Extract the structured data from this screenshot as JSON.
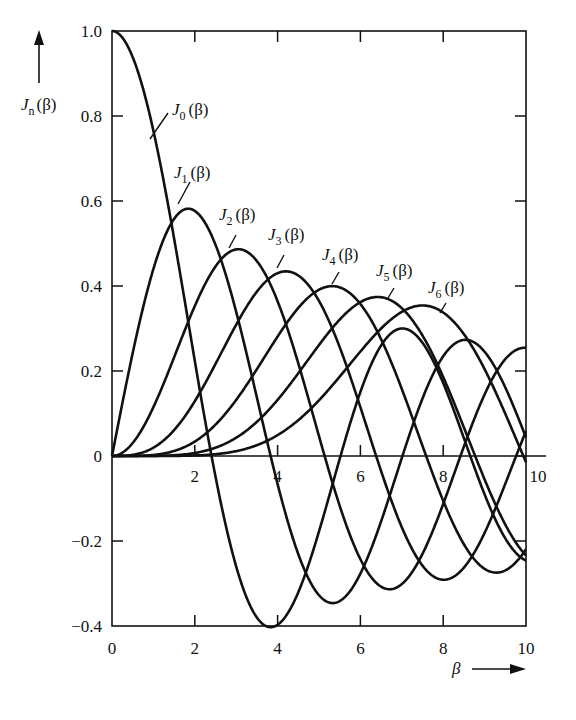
{
  "chart_data": {
    "type": "line",
    "title": "",
    "xlabel": "β",
    "ylabel": "J_n(β)",
    "xlim": [
      0,
      10
    ],
    "ylim": [
      -0.4,
      1.0
    ],
    "grid": false,
    "legend_position": "inline labels",
    "x_ticks": [
      0,
      2,
      4,
      6,
      8,
      10
    ],
    "x_tick_labels_bottom": [
      "0",
      "2",
      "4",
      "6",
      "8",
      "10"
    ],
    "x_tick_labels_zero_line": [
      "2",
      "4",
      "6",
      "8",
      "10"
    ],
    "y_ticks": [
      -0.4,
      -0.2,
      0,
      0.2,
      0.4,
      0.6,
      0.8,
      1.0
    ],
    "y_tick_labels": [
      "-0.4",
      "-0.2",
      "0",
      "0.2",
      "0.4",
      "0.6",
      "0.8",
      "1.0"
    ],
    "series": [
      {
        "name": "J0(β)",
        "order": 0,
        "label_main": "J",
        "label_sub": "0",
        "label_arg": "(β)",
        "peak": {
          "x": 0,
          "y": 1.0
        },
        "x": [
          0,
          1,
          2,
          2.405,
          3,
          3.83,
          4,
          5,
          5.52,
          6,
          7,
          7.02,
          8,
          8.65,
          9,
          10
        ],
        "values": [
          1.0,
          0.765,
          0.224,
          0,
          -0.26,
          -0.403,
          -0.397,
          -0.178,
          0,
          0.151,
          0.3,
          0.3,
          0.172,
          0,
          -0.09,
          -0.246
        ]
      },
      {
        "name": "J1(β)",
        "order": 1,
        "label_main": "J",
        "label_sub": "1",
        "label_arg": "(β)",
        "peak": {
          "x": 1.84,
          "y": 0.582
        },
        "x": [
          0,
          1,
          1.84,
          2,
          3,
          3.83,
          4,
          5,
          5.33,
          6,
          7,
          7.02,
          8,
          9,
          10
        ],
        "values": [
          0,
          0.44,
          0.582,
          0.577,
          0.339,
          0,
          -0.066,
          -0.328,
          -0.346,
          -0.277,
          -0.005,
          0,
          0.235,
          0.245,
          0.043
        ]
      },
      {
        "name": "J2(β)",
        "order": 2,
        "label_main": "J",
        "label_sub": "2",
        "label_arg": "(β)",
        "peak": {
          "x": 3.05,
          "y": 0.486
        },
        "x": [
          0,
          1,
          2,
          3,
          3.05,
          4,
          5,
          5.14,
          6,
          6.71,
          7,
          8,
          8.42,
          9,
          10
        ],
        "values": [
          0,
          0.115,
          0.353,
          0.486,
          0.486,
          0.364,
          0.047,
          0,
          -0.243,
          -0.301,
          -0.301,
          -0.113,
          0,
          0.145,
          0.255
        ]
      },
      {
        "name": "J3(β)",
        "order": 3,
        "label_main": "J",
        "label_sub": "3",
        "label_arg": "(β)",
        "peak": {
          "x": 4.2,
          "y": 0.434
        },
        "x": [
          0,
          1,
          2,
          3,
          4,
          4.2,
          5,
          6,
          6.38,
          7,
          8,
          8.02,
          9,
          9.76,
          10
        ],
        "values": [
          0,
          0.02,
          0.129,
          0.309,
          0.43,
          0.434,
          0.365,
          0.115,
          0,
          -0.168,
          -0.291,
          -0.291,
          -0.181,
          0,
          0.058
        ]
      },
      {
        "name": "J4(β)",
        "order": 4,
        "label_main": "J",
        "label_sub": "4",
        "label_arg": "(β)",
        "peak": {
          "x": 5.32,
          "y": 0.4
        },
        "x": [
          0,
          1,
          2,
          3,
          4,
          5,
          5.32,
          6,
          7,
          7.59,
          8,
          9,
          9.28,
          10
        ],
        "values": [
          0,
          0.002,
          0.034,
          0.132,
          0.281,
          0.391,
          0.4,
          0.358,
          0.158,
          0,
          -0.105,
          -0.265,
          -0.269,
          -0.22
        ]
      },
      {
        "name": "J5(β)",
        "order": 5,
        "label_main": "J",
        "label_sub": "5",
        "label_arg": "(β)",
        "peak": {
          "x": 6.42,
          "y": 0.375
        },
        "x": [
          0,
          2,
          3,
          4,
          5,
          6,
          6.42,
          7,
          8,
          8.77,
          9,
          10
        ],
        "values": [
          0,
          0.007,
          0.043,
          0.132,
          0.261,
          0.362,
          0.375,
          0.348,
          0.186,
          0,
          -0.055,
          -0.234
        ]
      },
      {
        "name": "J6(β)",
        "order": 6,
        "label_main": "J",
        "label_sub": "6",
        "label_arg": "(β)",
        "peak": {
          "x": 7.5,
          "y": 0.355
        },
        "x": [
          0,
          2,
          3,
          4,
          5,
          6,
          7,
          7.5,
          8,
          9,
          9.94,
          10
        ],
        "values": [
          0,
          0.001,
          0.011,
          0.049,
          0.131,
          0.246,
          0.339,
          0.355,
          0.338,
          0.204,
          0,
          -0.014
        ]
      }
    ],
    "annotations": [
      {
        "text": "J_n(β) ↑",
        "position": "top-left y-axis label with upward arrow"
      },
      {
        "text": "β →",
        "position": "bottom-right x-axis label with rightward arrow"
      }
    ]
  },
  "axes": {
    "y_label_main": "J",
    "y_label_sub": "n",
    "y_label_arg": "(β)",
    "x_label": "β"
  },
  "colors": {
    "ink": "#111111",
    "background": "#ffffff"
  }
}
